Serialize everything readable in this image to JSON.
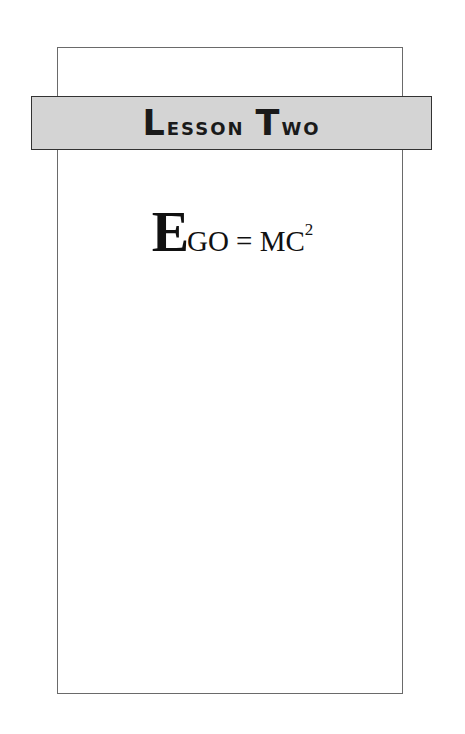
{
  "banner": {
    "word1_cap": "L",
    "word1_rest": "esson",
    "word2_cap": "T",
    "word2_rest": "wo",
    "full_text": "Lesson Two"
  },
  "equation": {
    "big_letter": "E",
    "rest": "GO = MC",
    "superscript": "2",
    "full_text": "EGO = MC²"
  },
  "colors": {
    "banner_fill": "#d4d4d4",
    "border": "#333333",
    "frame_line": "#6a6a6a"
  }
}
